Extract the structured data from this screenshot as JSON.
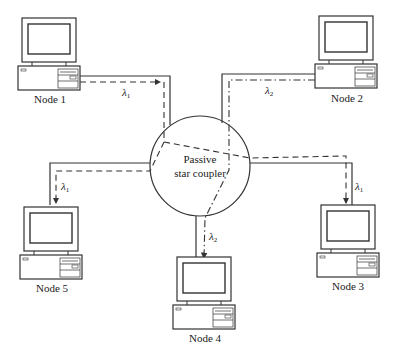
{
  "diagram": {
    "coupler_label_line1": "Passive",
    "coupler_label_line2": "star coupler",
    "nodes": [
      {
        "id": 1,
        "label": "Node 1"
      },
      {
        "id": 2,
        "label": "Node 2"
      },
      {
        "id": 3,
        "label": "Node 3"
      },
      {
        "id": 4,
        "label": "Node 4"
      },
      {
        "id": 5,
        "label": "Node 5"
      }
    ],
    "wavelengths": {
      "node1_tx": {
        "symbol": "λ",
        "sub": "1"
      },
      "node2_tx": {
        "symbol": "λ",
        "sub": "2"
      },
      "node3_rx": {
        "symbol": "λ",
        "sub": "1"
      },
      "node4_rx": {
        "symbol": "λ",
        "sub": "2"
      },
      "node5_rx": {
        "symbol": "λ",
        "sub": "1"
      }
    },
    "colors": {
      "stroke": "#333333",
      "background": "#ffffff"
    }
  }
}
